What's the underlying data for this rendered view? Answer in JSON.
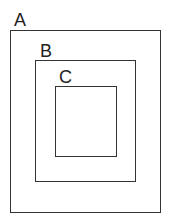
{
  "diagram": {
    "type": "nested-sets",
    "line_color": "#333333",
    "background_color": "#ffffff",
    "sets": [
      {
        "id": "A",
        "label": "A",
        "contains": [
          "B"
        ]
      },
      {
        "id": "B",
        "label": "B",
        "contains": [
          "C"
        ]
      },
      {
        "id": "C",
        "label": "C",
        "contains": []
      }
    ]
  }
}
